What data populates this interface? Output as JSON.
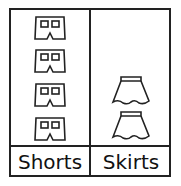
{
  "chart_data": {
    "type": "pictograph",
    "title": "",
    "categories": [
      "Shorts",
      "Skirts"
    ],
    "values": [
      4,
      2
    ],
    "icons": [
      "shorts-icon",
      "skirt-icon"
    ],
    "xlabel": "",
    "ylabel": ""
  },
  "labels": {
    "shorts": "Shorts",
    "skirts": "Skirts"
  }
}
